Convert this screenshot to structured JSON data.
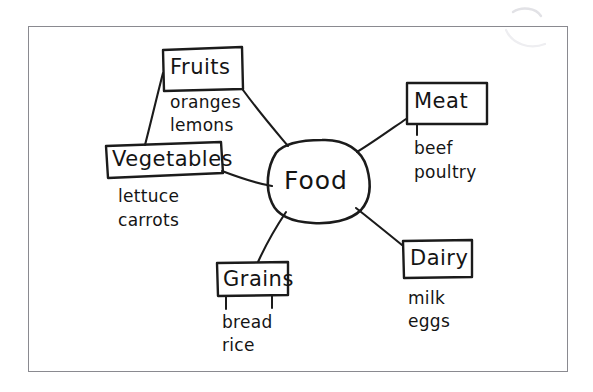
{
  "diagram": {
    "type": "mind-map",
    "title": "Food",
    "center": {
      "label": "Food",
      "shape": "rounded-blob"
    },
    "branches": [
      {
        "id": "fruits",
        "label": "Fruits",
        "items": [
          "oranges",
          "lemons"
        ]
      },
      {
        "id": "vegetables",
        "label": "Vegetables",
        "items": [
          "lettuce",
          "carrots"
        ]
      },
      {
        "id": "meat",
        "label": "Meat",
        "items": [
          "beef",
          "poultry"
        ]
      },
      {
        "id": "dairy",
        "label": "Dairy",
        "items": [
          "milk",
          "eggs"
        ]
      },
      {
        "id": "grains",
        "label": "Grains",
        "items": [
          "bread",
          "rice"
        ]
      }
    ],
    "colors": {
      "ink": "#1b1b1b",
      "page_frame": "#8a8a90",
      "background": "#ffffff",
      "ghost": "#e9e9ec"
    }
  },
  "ghost_marks": {
    "top_right": "~",
    "bottom_center": "",
    "left": ""
  }
}
